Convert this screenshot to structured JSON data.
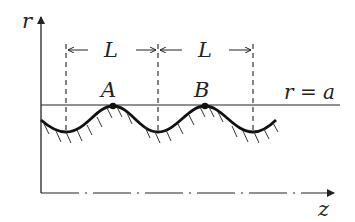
{
  "diagram": {
    "axes": {
      "vertical_label": "r",
      "horizontal_label": "z"
    },
    "spacing_labels": [
      "L",
      "L"
    ],
    "points": [
      {
        "label": "A"
      },
      {
        "label": "B"
      }
    ],
    "reference_line_label": "r = a",
    "colors": {
      "ink": "#222222",
      "background": "#ffffff"
    }
  }
}
